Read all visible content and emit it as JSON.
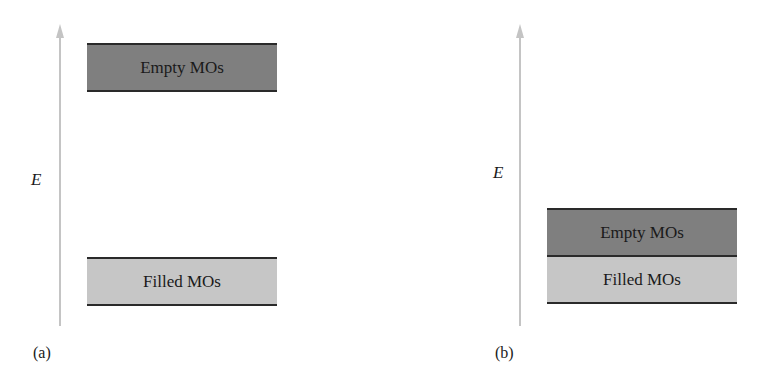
{
  "panels": [
    {
      "label": "(a)",
      "axis_label": "E",
      "bands": {
        "empty": "Empty MOs",
        "filled": "Filled MOs"
      }
    },
    {
      "label": "(b)",
      "axis_label": "E",
      "bands": {
        "empty": "Empty MOs",
        "filled": "Filled MOs"
      }
    }
  ],
  "colors": {
    "empty_band": "#7f7f7f",
    "filled_band": "#c6c6c6",
    "axis": "#c4c4c4"
  }
}
